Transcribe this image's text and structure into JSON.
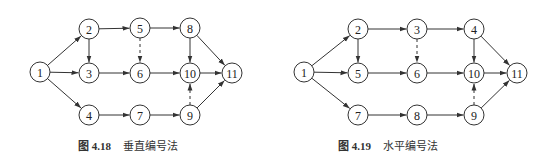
{
  "figures": [
    {
      "id": "fig-4-18",
      "caption": {
        "label": "图 4.18",
        "title": "垂直编号法"
      },
      "nodes": [
        {
          "id": "1",
          "x": 40,
          "y": 72
        },
        {
          "id": "2",
          "x": 89,
          "y": 29
        },
        {
          "id": "3",
          "x": 89,
          "y": 73
        },
        {
          "id": "4",
          "x": 89,
          "y": 115
        },
        {
          "id": "5",
          "x": 140,
          "y": 28
        },
        {
          "id": "6",
          "x": 140,
          "y": 73
        },
        {
          "id": "7",
          "x": 140,
          "y": 115
        },
        {
          "id": "8",
          "x": 190,
          "y": 28
        },
        {
          "id": "10",
          "x": 190,
          "y": 73
        },
        {
          "id": "9",
          "x": 190,
          "y": 115
        },
        {
          "id": "11",
          "x": 232,
          "y": 73
        }
      ],
      "edges": [
        {
          "from": "1",
          "to": "2",
          "dashed": false
        },
        {
          "from": "1",
          "to": "3",
          "dashed": false
        },
        {
          "from": "1",
          "to": "4",
          "dashed": false
        },
        {
          "from": "2",
          "to": "5",
          "dashed": false
        },
        {
          "from": "2",
          "to": "3",
          "dashed": false
        },
        {
          "from": "3",
          "to": "6",
          "dashed": false
        },
        {
          "from": "4",
          "to": "7",
          "dashed": false
        },
        {
          "from": "5",
          "to": "8",
          "dashed": false
        },
        {
          "from": "5",
          "to": "6",
          "dashed": true
        },
        {
          "from": "6",
          "to": "10",
          "dashed": false
        },
        {
          "from": "7",
          "to": "9",
          "dashed": false
        },
        {
          "from": "8",
          "to": "10",
          "dashed": false
        },
        {
          "from": "8",
          "to": "11",
          "dashed": false
        },
        {
          "from": "10",
          "to": "11",
          "dashed": false
        },
        {
          "from": "9",
          "to": "10",
          "dashed": true
        },
        {
          "from": "9",
          "to": "11",
          "dashed": false
        }
      ]
    },
    {
      "id": "fig-4-19",
      "caption": {
        "label": "图 4.19",
        "title": "水平编号法"
      },
      "nodes": [
        {
          "id": "1",
          "x": 304,
          "y": 72
        },
        {
          "id": "2",
          "x": 358,
          "y": 29
        },
        {
          "id": "5",
          "x": 358,
          "y": 73
        },
        {
          "id": "7",
          "x": 358,
          "y": 115
        },
        {
          "id": "3",
          "x": 417,
          "y": 29
        },
        {
          "id": "6",
          "x": 417,
          "y": 73
        },
        {
          "id": "8",
          "x": 417,
          "y": 115
        },
        {
          "id": "4",
          "x": 474,
          "y": 29
        },
        {
          "id": "10",
          "x": 474,
          "y": 73
        },
        {
          "id": "9",
          "x": 474,
          "y": 115
        },
        {
          "id": "11",
          "x": 517,
          "y": 73
        }
      ],
      "edges": [
        {
          "from": "1",
          "to": "2",
          "dashed": false
        },
        {
          "from": "1",
          "to": "5",
          "dashed": false
        },
        {
          "from": "1",
          "to": "7",
          "dashed": false
        },
        {
          "from": "2",
          "to": "3",
          "dashed": false
        },
        {
          "from": "2",
          "to": "5",
          "dashed": false
        },
        {
          "from": "5",
          "to": "6",
          "dashed": false
        },
        {
          "from": "7",
          "to": "8",
          "dashed": false
        },
        {
          "from": "3",
          "to": "4",
          "dashed": false
        },
        {
          "from": "3",
          "to": "6",
          "dashed": true
        },
        {
          "from": "6",
          "to": "10",
          "dashed": false
        },
        {
          "from": "8",
          "to": "9",
          "dashed": false
        },
        {
          "from": "4",
          "to": "10",
          "dashed": false
        },
        {
          "from": "4",
          "to": "11",
          "dashed": false
        },
        {
          "from": "10",
          "to": "11",
          "dashed": false
        },
        {
          "from": "9",
          "to": "10",
          "dashed": true
        },
        {
          "from": "9",
          "to": "11",
          "dashed": false
        }
      ]
    }
  ],
  "style": {
    "node_radius": 10,
    "stroke_color": "#333333"
  }
}
